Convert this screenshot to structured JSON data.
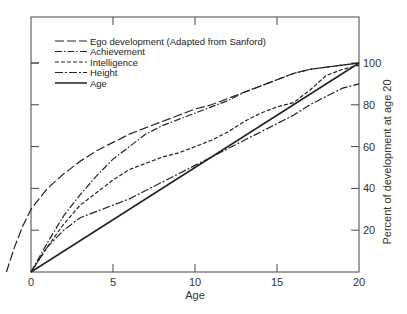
{
  "chart_data": {
    "type": "line",
    "title": "",
    "xlabel": "Age",
    "ylabel": "Percent of development at age 20",
    "xlim": [
      0,
      20
    ],
    "ylim": [
      0,
      110
    ],
    "x_ticks": [
      "0",
      "5",
      "10",
      "15",
      "20"
    ],
    "y_ticks": [
      "20",
      "40",
      "60",
      "80",
      "100"
    ],
    "grid": false,
    "legend_position": "upper-left",
    "series": [
      {
        "name": "Ego development (Adapted from Sanford)",
        "style": "long-dash",
        "x": [
          -1.5,
          -1,
          -0.5,
          0,
          1,
          2,
          3,
          4,
          5,
          6,
          7,
          8,
          9,
          10,
          11,
          12,
          13,
          14,
          15,
          16,
          17,
          18,
          19,
          20
        ],
        "y": [
          0,
          12,
          22,
          30,
          40,
          47,
          53,
          58,
          62,
          66,
          69,
          72,
          75,
          78,
          80,
          83,
          86,
          89,
          92,
          95,
          97,
          98,
          99,
          100
        ]
      },
      {
        "name": "Achievement",
        "style": "dash-dot",
        "x": [
          0,
          1,
          2,
          3,
          4,
          5,
          6,
          7,
          8,
          9,
          10,
          11,
          12,
          13,
          14,
          15,
          16,
          17,
          18,
          19,
          20
        ],
        "y": [
          0,
          14,
          27,
          37,
          46,
          54,
          60,
          66,
          70,
          73,
          76,
          79,
          82,
          86,
          89,
          92,
          95,
          97,
          98,
          99,
          100
        ]
      },
      {
        "name": "Intelligence",
        "style": "short-dash",
        "x": [
          0,
          1,
          2,
          3,
          4,
          5,
          6,
          7,
          8,
          9,
          10,
          11,
          12,
          13,
          14,
          15,
          16,
          17,
          18,
          19,
          20
        ],
        "y": [
          0,
          12,
          23,
          32,
          38,
          44,
          49,
          52,
          55,
          57,
          60,
          63,
          67,
          72,
          76,
          79,
          81,
          87,
          94,
          97,
          99
        ]
      },
      {
        "name": "Height",
        "style": "dash-dot-dot",
        "x": [
          0,
          1,
          2,
          3,
          4,
          5,
          6,
          7,
          8,
          9,
          10,
          11,
          12,
          13,
          14,
          15,
          16,
          17,
          18,
          19,
          20
        ],
        "y": [
          0,
          12,
          20,
          26,
          29,
          32,
          35,
          39,
          43,
          47,
          51,
          55,
          59,
          63,
          67,
          71,
          75,
          80,
          84,
          88,
          90
        ]
      },
      {
        "name": "Age",
        "style": "solid",
        "x": [
          0,
          20
        ],
        "y": [
          0,
          100
        ]
      }
    ]
  }
}
